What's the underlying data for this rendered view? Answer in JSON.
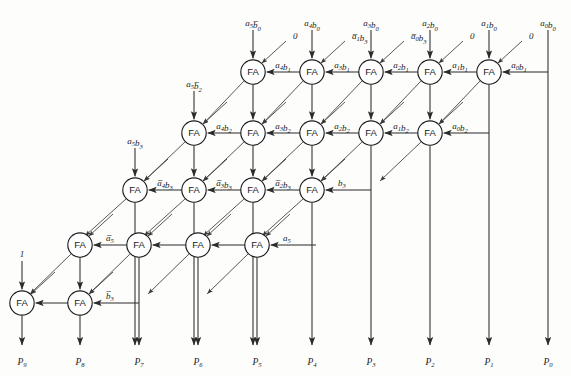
{
  "diagram": {
    "cell_label": "FA",
    "colors": {
      "wire": "#2b2b2b",
      "text": "#1a1a1a",
      "background": "#fdfdfc"
    },
    "rows": [
      {
        "row_index": 0,
        "y": 72,
        "cells": [
          {
            "x": 253,
            "top_input": "a5b0bar",
            "diag_input": "0",
            "side_input": "a4b1"
          },
          {
            "x": 312,
            "top_input": "a4b0",
            "diag_input": "a1b3bar",
            "side_input": "a3b1"
          },
          {
            "x": 371,
            "top_input": "a3b0",
            "diag_input": "a0b3bar",
            "side_input": "a2b1"
          },
          {
            "x": 430,
            "top_input": "a2b0",
            "diag_input": "0",
            "side_input": "a1b1"
          },
          {
            "x": 489,
            "top_input": "a1b0",
            "diag_input": "0",
            "side_input": "a0b1"
          }
        ]
      },
      {
        "row_index": 1,
        "y": 133,
        "cells": [
          {
            "x": 194,
            "top_input": "a5b2bar",
            "diag_input": null,
            "side_input": "a4b2"
          },
          {
            "x": 253,
            "top_input": null,
            "diag_input": null,
            "side_input": "a3b2"
          },
          {
            "x": 312,
            "top_input": null,
            "diag_input": null,
            "side_input": "a2b2"
          },
          {
            "x": 371,
            "top_input": null,
            "diag_input": null,
            "side_input": "a1b2"
          },
          {
            "x": 430,
            "top_input": null,
            "diag_input": null,
            "side_input": "a0b2"
          }
        ]
      },
      {
        "row_index": 2,
        "y": 190,
        "cells": [
          {
            "x": 135,
            "top_input": "a5b3",
            "diag_input": null,
            "side_input": "a4b3bar"
          },
          {
            "x": 194,
            "top_input": null,
            "diag_input": null,
            "side_input": "a3b3bar"
          },
          {
            "x": 253,
            "top_input": null,
            "diag_input": null,
            "side_input": "a2b3bar"
          },
          {
            "x": 312,
            "top_input": null,
            "diag_input": null,
            "side_input": "b3"
          }
        ]
      },
      {
        "row_index": 3,
        "y": 245,
        "cells": [
          {
            "x": 80,
            "top_input": null,
            "diag_input": null,
            "side_input": "a5bar"
          },
          {
            "x": 139,
            "top_input": null,
            "diag_input": null,
            "side_input": null
          },
          {
            "x": 198,
            "top_input": null,
            "diag_input": null,
            "side_input": null
          },
          {
            "x": 257,
            "top_input": null,
            "diag_input": null,
            "side_input": "a5"
          }
        ]
      },
      {
        "row_index": 4,
        "y": 303,
        "cells": [
          {
            "x": 22,
            "top_input": "one",
            "diag_input": null,
            "side_input": null
          },
          {
            "x": 80,
            "top_input": null,
            "diag_input": null,
            "side_input": "b3bar"
          }
        ]
      }
    ],
    "signal_labels": {
      "a5b0bar": {
        "base": "a",
        "sub1": "5",
        "term2": "b",
        "sub2": "0",
        "bar2": true,
        "bar1": false
      },
      "a4b0": {
        "base": "a",
        "sub1": "4",
        "term2": "b",
        "sub2": "0",
        "bar2": false,
        "bar1": false
      },
      "a3b0": {
        "base": "a",
        "sub1": "3",
        "term2": "b",
        "sub2": "0",
        "bar2": false,
        "bar1": false
      },
      "a2b0": {
        "base": "a",
        "sub1": "2",
        "term2": "b",
        "sub2": "0",
        "bar2": false,
        "bar1": false
      },
      "a1b0": {
        "base": "a",
        "sub1": "1",
        "term2": "b",
        "sub2": "0",
        "bar2": false,
        "bar1": false
      },
      "a0b0": {
        "base": "a",
        "sub1": "0",
        "term2": "b",
        "sub2": "0",
        "bar2": false,
        "bar1": false
      },
      "a4b1": {
        "base": "a",
        "sub1": "4",
        "term2": "b",
        "sub2": "1",
        "bar2": false,
        "bar1": false
      },
      "a3b1": {
        "base": "a",
        "sub1": "3",
        "term2": "b",
        "sub2": "1",
        "bar2": false,
        "bar1": false
      },
      "a2b1": {
        "base": "a",
        "sub1": "2",
        "term2": "b",
        "sub2": "1",
        "bar2": false,
        "bar1": false
      },
      "a1b1": {
        "base": "a",
        "sub1": "1",
        "term2": "b",
        "sub2": "1",
        "bar2": false,
        "bar1": false
      },
      "a0b1": {
        "base": "a",
        "sub1": "0",
        "term2": "b",
        "sub2": "1",
        "bar2": false,
        "bar1": false
      },
      "a5b2bar": {
        "base": "a",
        "sub1": "5",
        "term2": "b",
        "sub2": "2",
        "bar2": true,
        "bar1": false
      },
      "a4b2": {
        "base": "a",
        "sub1": "4",
        "term2": "b",
        "sub2": "2",
        "bar2": false,
        "bar1": false
      },
      "a3b2": {
        "base": "a",
        "sub1": "3",
        "term2": "b",
        "sub2": "2",
        "bar2": false,
        "bar1": false
      },
      "a2b2": {
        "base": "a",
        "sub1": "2",
        "term2": "b",
        "sub2": "2",
        "bar2": false,
        "bar1": false
      },
      "a1b2": {
        "base": "a",
        "sub1": "1",
        "term2": "b",
        "sub2": "2",
        "bar2": false,
        "bar1": false
      },
      "a0b2": {
        "base": "a",
        "sub1": "0",
        "term2": "b",
        "sub2": "2",
        "bar2": false,
        "bar1": false
      },
      "a1b3bar": {
        "base": "a",
        "sub1": "1",
        "term2": "b",
        "sub2": "3",
        "bar2": false,
        "bar1": true
      },
      "a0b3bar": {
        "base": "a",
        "sub1": "0",
        "term2": "b",
        "sub2": "3",
        "bar2": false,
        "bar1": true
      },
      "a5b3": {
        "base": "a",
        "sub1": "5",
        "term2": "b",
        "sub2": "3",
        "bar2": false,
        "bar1": false
      },
      "a4b3bar": {
        "base": "a",
        "sub1": "4",
        "term2": "b",
        "sub2": "3",
        "bar2": false,
        "bar1": true
      },
      "a3b3bar": {
        "base": "a",
        "sub1": "3",
        "term2": "b",
        "sub2": "3",
        "bar2": false,
        "bar1": true
      },
      "a2b3bar": {
        "base": "a",
        "sub1": "2",
        "term2": "b",
        "sub2": "3",
        "bar2": false,
        "bar1": true
      },
      "b3": {
        "base": "b",
        "sub1": "3",
        "term2": "",
        "sub2": "",
        "bar2": false,
        "bar1": false
      },
      "b3bar": {
        "base": "b",
        "sub1": "3",
        "term2": "",
        "sub2": "",
        "bar2": false,
        "bar1": true
      },
      "a5": {
        "base": "a",
        "sub1": "5",
        "term2": "",
        "sub2": "",
        "bar2": false,
        "bar1": false
      },
      "a5bar": {
        "base": "a",
        "sub1": "5",
        "term2": "",
        "sub2": "",
        "bar2": false,
        "bar1": true
      },
      "0": {
        "base": "0",
        "sub1": "",
        "term2": "",
        "sub2": "",
        "bar2": false,
        "bar1": false
      },
      "one": {
        "base": "1",
        "sub1": "",
        "term2": "",
        "sub2": "",
        "bar2": false,
        "bar1": false
      }
    },
    "top_inputs": [
      {
        "label": "a5b0bar",
        "x": 213,
        "text_x": 200,
        "arrow_to_y": 60
      },
      {
        "label": "a4b0",
        "x": 312,
        "text_x": 300,
        "arrow_to_y": 60
      },
      {
        "label": "a3b0",
        "x": 371,
        "text_x": 359,
        "arrow_to_y": 60
      },
      {
        "label": "a2b0",
        "x": 430,
        "text_x": 418,
        "arrow_to_y": 60
      },
      {
        "label": "a1b0",
        "x": 489,
        "text_x": 477,
        "arrow_to_y": 60
      },
      {
        "label": "a0b0",
        "x": 548,
        "text_x": 536,
        "arrow_to_y": 60
      }
    ],
    "outputs": [
      {
        "label": "P9",
        "sub": "9",
        "x": 22
      },
      {
        "label": "P8",
        "sub": "8",
        "x": 80
      },
      {
        "label": "P7",
        "sub": "7",
        "x": 139
      },
      {
        "label": "P6",
        "sub": "6",
        "x": 198
      },
      {
        "label": "P5",
        "sub": "5",
        "x": 257
      },
      {
        "label": "P4",
        "sub": "4",
        "x": 312
      },
      {
        "label": "P3",
        "sub": "3",
        "x": 371
      },
      {
        "label": "P2",
        "sub": "2",
        "x": 430
      },
      {
        "label": "P1",
        "sub": "1",
        "x": 489
      },
      {
        "label": "P0",
        "sub": "0",
        "x": 548
      }
    ],
    "output_prefix": "P"
  }
}
